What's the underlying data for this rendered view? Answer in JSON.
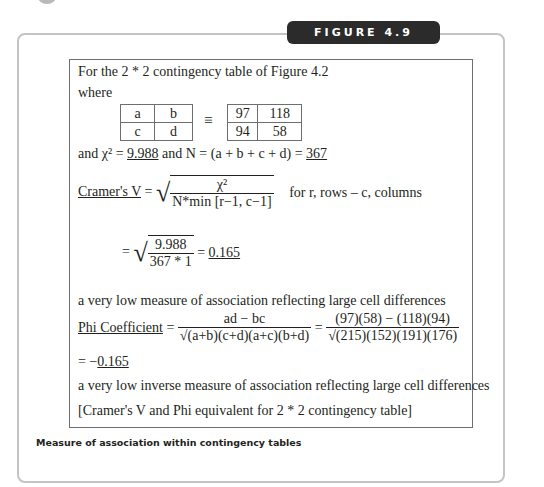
{
  "figure": {
    "label": "FIGURE 4.9",
    "caption": "Measure of association within contingency tables"
  },
  "content": {
    "intro": "For the 2 * 2 contingency table of Figure 4.2",
    "where": "where",
    "symbolic_table": [
      [
        "a",
        "b"
      ],
      [
        "c",
        "d"
      ]
    ],
    "equiv_symbol": "≡",
    "value_table": [
      [
        "97",
        "118"
      ],
      [
        "94",
        "58"
      ]
    ],
    "chi_line": {
      "prefix": "and χ² = ",
      "chi_value": "9.988",
      "middle": " and N = (a + b + c + d) = ",
      "n_value": "367"
    },
    "cramers": {
      "label": "Cramer's V",
      "equals": " = ",
      "numerator": "χ²",
      "denominator": "N*min [r−1, c−1]",
      "note": "for r, rows – c, columns",
      "calc_numerator": "9.988",
      "calc_denominator": "367 * 1",
      "result_prefix": " = ",
      "result": "0.165"
    },
    "cramers_interpretation": "a very low measure of association reflecting large cell differences",
    "phi": {
      "label": "Phi Coefficient",
      "equals": " = ",
      "numerator": "ad − bc",
      "denominator": "(a+b)(c+d)(a+c)(b+d)",
      "equals2": " = ",
      "calc_numerator": "(97)(58) − (118)(94)",
      "calc_denominator": "(215)(152)(191)(176)",
      "result_prefix": "= −",
      "result": "0.165"
    },
    "phi_interpretation": "a very low inverse measure of association reflecting large cell differences",
    "footnote": "[Cramer's V and Phi equivalent for 2 * 2 contingency table]"
  }
}
